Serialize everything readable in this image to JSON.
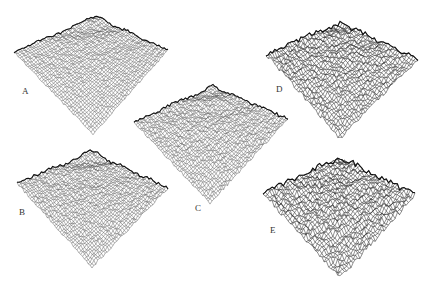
{
  "figure": {
    "panels": [
      {
        "label": "A",
        "roughness": 0.25,
        "grid_density": "fine",
        "ridge_strength": 0.55
      },
      {
        "label": "B",
        "roughness": 0.4,
        "grid_density": "fine",
        "ridge_strength": 0.7
      },
      {
        "label": "C",
        "roughness": 0.45,
        "grid_density": "fine",
        "ridge_strength": 0.6
      },
      {
        "label": "D",
        "roughness": 0.75,
        "grid_density": "coarse",
        "ridge_strength": 0.5
      },
      {
        "label": "E",
        "roughness": 1.0,
        "grid_density": "coarse",
        "ridge_strength": 0.4
      }
    ]
  }
}
